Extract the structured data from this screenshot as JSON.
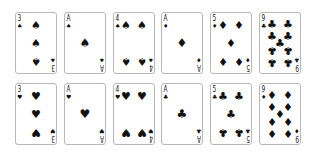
{
  "cards": [
    {
      "row": 0,
      "col": 0,
      "rank": "3",
      "suit": "spade",
      "glyph": "♠"
    },
    {
      "row": 0,
      "col": 1,
      "rank": "A",
      "suit": "spade",
      "glyph": "♠"
    },
    {
      "row": 0,
      "col": 2,
      "rank": "4",
      "suit": "spade",
      "glyph": "♠"
    },
    {
      "row": 0,
      "col": 3,
      "rank": "A",
      "suit": "diamond",
      "glyph": "♦"
    },
    {
      "row": 0,
      "col": 4,
      "rank": "5",
      "suit": "diamond",
      "glyph": "♦"
    },
    {
      "row": 0,
      "col": 5,
      "rank": "9",
      "suit": "club",
      "glyph": "♣"
    },
    {
      "row": 1,
      "col": 0,
      "rank": "3",
      "suit": "heart",
      "glyph": "♥"
    },
    {
      "row": 1,
      "col": 1,
      "rank": "A",
      "suit": "heart",
      "glyph": "♥"
    },
    {
      "row": 1,
      "col": 2,
      "rank": "4",
      "suit": "heart",
      "glyph": "♥"
    },
    {
      "row": 1,
      "col": 3,
      "rank": "A",
      "suit": "club",
      "glyph": "♣"
    },
    {
      "row": 1,
      "col": 4,
      "rank": "5",
      "suit": "club",
      "glyph": "♣"
    },
    {
      "row": 1,
      "col": 5,
      "rank": "9",
      "suit": "diamond",
      "glyph": "♦"
    }
  ],
  "colors": {
    "ink": "#111111",
    "border": "#b8b8b8",
    "background": "#ffffff"
  }
}
